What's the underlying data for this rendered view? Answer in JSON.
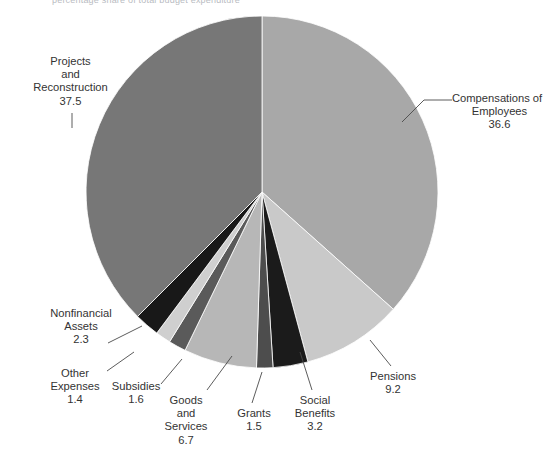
{
  "figure": {
    "top_caption": "percentage share of total budget expenditure"
  },
  "chart_data": {
    "type": "pie",
    "title": "",
    "unit": "percent",
    "total": 100.0,
    "start_angle_deg": 0,
    "direction": "clockwise",
    "legend": "none",
    "labels_outside": true,
    "categories": [
      "Compensations of Employees",
      "Pensions",
      "Social Benefits",
      "Grants",
      "Goods and Services",
      "Subsidies",
      "Other Expenses",
      "Nonfinancial Assets",
      "Projects and Reconstruction"
    ],
    "values": [
      36.6,
      9.2,
      3.2,
      1.5,
      6.7,
      1.6,
      1.4,
      2.3,
      37.5
    ],
    "colors": [
      "#a8a8a8",
      "#c9c9c9",
      "#1b1b1b",
      "#4d4d4d",
      "#b7b7b7",
      "#5a5a5a",
      "#cfcfcf",
      "#181818",
      "#777777"
    ],
    "slices": [
      {
        "name": "Compensations of Employees",
        "value": 36.6,
        "value_text": "36.6",
        "label_lines": [
          "Compensations of",
          "Employees"
        ],
        "color": "#a8a8a8"
      },
      {
        "name": "Pensions",
        "value": 9.2,
        "value_text": "9.2",
        "label_lines": [
          "Pensions"
        ],
        "color": "#c9c9c9"
      },
      {
        "name": "Social Benefits",
        "value": 3.2,
        "value_text": "3.2",
        "label_lines": [
          "Social",
          "Benefits"
        ],
        "color": "#1b1b1b"
      },
      {
        "name": "Grants",
        "value": 1.5,
        "value_text": "1.5",
        "label_lines": [
          "Grants"
        ],
        "color": "#4d4d4d"
      },
      {
        "name": "Goods and Services",
        "value": 6.7,
        "value_text": "6.7",
        "label_lines": [
          "Goods",
          "and",
          "Services"
        ],
        "color": "#b7b7b7"
      },
      {
        "name": "Subsidies",
        "value": 1.6,
        "value_text": "1.6",
        "label_lines": [
          "Subsidies"
        ],
        "color": "#5a5a5a"
      },
      {
        "name": "Other Expenses",
        "value": 1.4,
        "value_text": "1.4",
        "label_lines": [
          "Other",
          "Expenses"
        ],
        "color": "#cfcfcf"
      },
      {
        "name": "Nonfinancial Assets",
        "value": 2.3,
        "value_text": "2.3",
        "label_lines": [
          "Nonfinancial",
          "Assets"
        ],
        "color": "#181818"
      },
      {
        "name": "Projects and Reconstruction",
        "value": 37.5,
        "value_text": "37.5",
        "label_lines": [
          "Projects",
          "and",
          "Reconstruction"
        ],
        "color": "#777777"
      }
    ]
  },
  "geometry": {
    "cx": 262,
    "cy": 192,
    "r": 176
  }
}
